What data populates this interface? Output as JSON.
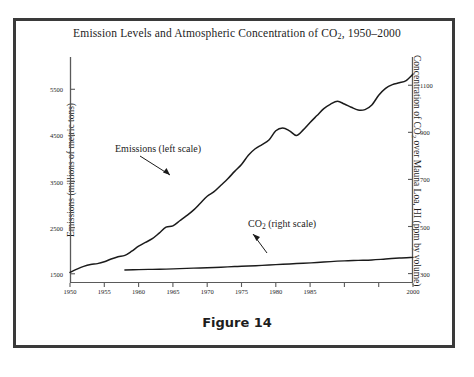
{
  "figure": {
    "caption": "Figure 14"
  },
  "chart_data": {
    "type": "line",
    "title": "Emission Levels and Atmospheric Concentration of CO2, 1950–2000",
    "title_parts": {
      "before_sub": "Emission Levels and Atmospheric Concentration of CO",
      "sub": "2",
      "after_sub": ", 1950–2000"
    },
    "xlabel": "",
    "xlim": [
      1950,
      2000
    ],
    "x_ticks": [
      1950,
      1955,
      1960,
      1965,
      1970,
      1975,
      1980,
      1985,
      1990,
      1995,
      2000
    ],
    "x_tick_labels": [
      "1950",
      "1955",
      "1960",
      "1965",
      "1970",
      "1975",
      "1980",
      "1985",
      "",
      "",
      "2000"
    ],
    "grid": false,
    "legend_position": "in-plot annotations",
    "left_axis": {
      "label": "Emissions (millions of metric tons)",
      "ylim": [
        1300,
        6200
      ],
      "ticks": [
        1500,
        2500,
        3500,
        4500,
        5500
      ],
      "tick_labels": [
        "1500",
        "2500",
        "3500",
        "4500",
        "5500"
      ]
    },
    "right_axis": {
      "label_parts": {
        "before_sub": "Concentration of CO",
        "sub": "2",
        "after_sub": " over Mauna Loa, HI (ppm by volume)"
      },
      "label": "Concentration of CO2 over Mauna Loa, HI (ppm by volume)",
      "ylim": [
        260,
        1220
      ],
      "ticks": [
        300,
        500,
        700,
        900,
        1100
      ],
      "tick_labels": [
        "300",
        "500",
        "700",
        "900",
        "1100"
      ]
    },
    "series": [
      {
        "name": "Emissions (left scale)",
        "axis": "left",
        "annotation": "Emissions (left scale)",
        "annotation_parts": {
          "text": "Emissions (left scale)"
        },
        "x": [
          1950,
          1951,
          1952,
          1953,
          1954,
          1955,
          1956,
          1957,
          1958,
          1959,
          1960,
          1961,
          1962,
          1963,
          1964,
          1965,
          1966,
          1967,
          1968,
          1969,
          1970,
          1971,
          1972,
          1973,
          1974,
          1975,
          1976,
          1977,
          1978,
          1979,
          1980,
          1981,
          1982,
          1983,
          1984,
          1985,
          1986,
          1987,
          1988,
          1989,
          1990,
          1991,
          1992,
          1993,
          1994,
          1995,
          1996,
          1997,
          1998,
          1999,
          2000
        ],
        "values": [
          1530,
          1600,
          1660,
          1700,
          1720,
          1760,
          1820,
          1870,
          1900,
          1990,
          2100,
          2180,
          2260,
          2380,
          2510,
          2540,
          2650,
          2760,
          2880,
          3030,
          3180,
          3280,
          3420,
          3560,
          3720,
          3870,
          4070,
          4210,
          4300,
          4400,
          4600,
          4660,
          4600,
          4500,
          4620,
          4780,
          4930,
          5080,
          5180,
          5240,
          5180,
          5110,
          5050,
          5060,
          5160,
          5370,
          5520,
          5600,
          5640,
          5690,
          5830
        ]
      },
      {
        "name": "CO2 (right scale)",
        "axis": "right",
        "annotation": "CO2 (right scale)",
        "annotation_parts": {
          "before_sub": "CO",
          "sub": "2",
          "after_sub": " (right scale)"
        },
        "x": [
          1958,
          1960,
          1962,
          1964,
          1966,
          1968,
          1970,
          1972,
          1974,
          1976,
          1978,
          1980,
          1982,
          1984,
          1986,
          1988,
          1990,
          1992,
          1994,
          1996,
          1998,
          2000
        ],
        "values": [
          315,
          317,
          318,
          319,
          321,
          323,
          325,
          327,
          330,
          332,
          335,
          338,
          341,
          344,
          347,
          351,
          354,
          356,
          358,
          362,
          366,
          369
        ]
      }
    ],
    "annotations": [
      {
        "name": "emissions-callout",
        "text": "Emissions (left scale)",
        "arrow": "points down-right to emissions curve"
      },
      {
        "name": "co2-callout",
        "text": "CO2 (right scale)",
        "arrow": "points down-left to CO2 line"
      }
    ]
  }
}
